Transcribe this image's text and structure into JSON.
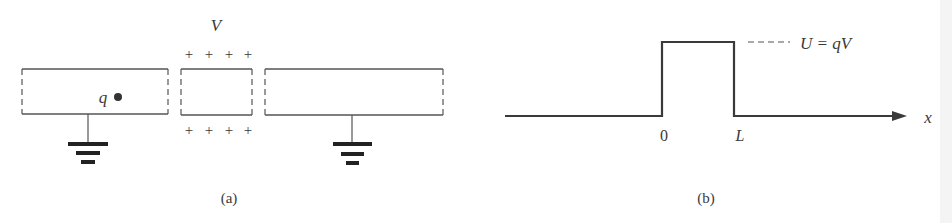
{
  "figure_a": {
    "caption": "(a)",
    "voltage_label": "V",
    "charge_label": "q",
    "plus_top": [
      "+",
      "+",
      "+",
      "+"
    ],
    "plus_bottom": [
      "+",
      "+",
      "+",
      "+"
    ]
  },
  "figure_b": {
    "caption": "(b)",
    "potential_label": "U = qV",
    "axis_label": "x",
    "tick_zero": "0",
    "tick_L": "L"
  },
  "colors": {
    "line": "#3a3a3a",
    "dashed": "#777777",
    "background": "#ffffff",
    "edge_band": "#f3f3f3"
  }
}
